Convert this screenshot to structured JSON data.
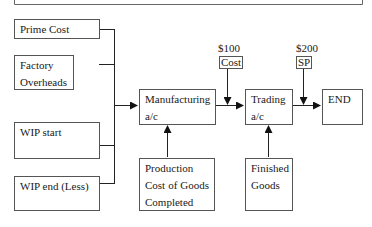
{
  "diagram": {
    "inputs": [
      {
        "id": "prime-cost",
        "label": "Prime Cost"
      },
      {
        "id": "factory-overheads",
        "label": "Factory Overheads"
      },
      {
        "id": "wip-start",
        "label": "WIP start"
      },
      {
        "id": "wip-end",
        "label": "WIP end (Less)"
      }
    ],
    "manufacturing": {
      "label": "Manufacturing a/c"
    },
    "production_cost": {
      "label": "Production Cost of Goods Completed"
    },
    "trading": {
      "label": "Trading a/c"
    },
    "finished_goods": {
      "label": "Finished Goods"
    },
    "end": {
      "label": "END"
    },
    "cost": {
      "amount": "$100",
      "label": "Cost"
    },
    "sp": {
      "amount": "$200",
      "label": "SP"
    }
  }
}
